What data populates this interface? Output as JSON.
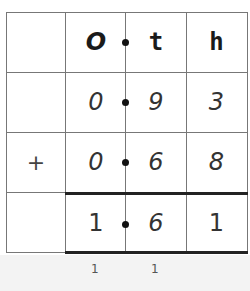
{
  "table": {
    "headers": [
      "",
      "O",
      "t",
      "h"
    ],
    "rows": [
      {
        "operator": "",
        "ones": "0",
        "tenths": "9",
        "hundredths": "3"
      },
      {
        "operator": "+",
        "ones": "0",
        "tenths": "6",
        "hundredths": "8"
      },
      {
        "operator": "",
        "ones": "1",
        "tenths": "6",
        "hundredths": "1"
      }
    ],
    "carries": {
      "ones": "1",
      "tenths": "1"
    }
  },
  "colors": {
    "grid": "#777777",
    "rule": "#222222",
    "text": "#333333"
  }
}
